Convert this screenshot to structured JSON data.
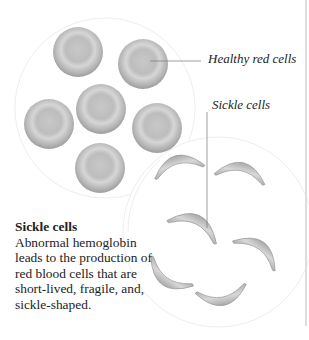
{
  "labels": {
    "healthy": "Healthy red cells",
    "sickle": "Sickle cells"
  },
  "caption": {
    "title": "Sickle cells",
    "body": "Abnormal hemoglobin leads to the production of red blood cells that are short-lived, fragile, and, sickle-shaped."
  },
  "colors": {
    "cell": "#b8b8b8",
    "outline": "#e8e8e8",
    "text": "#222222"
  }
}
